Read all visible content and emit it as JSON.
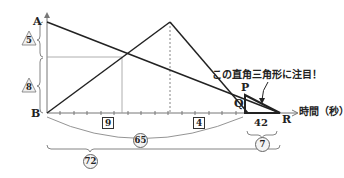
{
  "diagram": {
    "points": {
      "A": "A",
      "B": "B",
      "P": "P",
      "Q": "Q",
      "R": "R"
    },
    "x_axis_label": "時間（秒）",
    "annotation": "この直角三角形に注目！",
    "left_ratios": [
      {
        "value": "5",
        "style": "triangle"
      },
      {
        "value": "8",
        "style": "triangle"
      }
    ],
    "segment_boxes": [
      {
        "value": "9",
        "style": "square"
      },
      {
        "value": "4",
        "style": "square"
      }
    ],
    "bottom_values": {
      "qr_time": "42",
      "qr_ratio": "7",
      "br_ratio_partial": "65",
      "total_ratio": "72"
    },
    "colors": {
      "line": "#222222",
      "grid": "#999999",
      "bracket": "#777777"
    }
  }
}
